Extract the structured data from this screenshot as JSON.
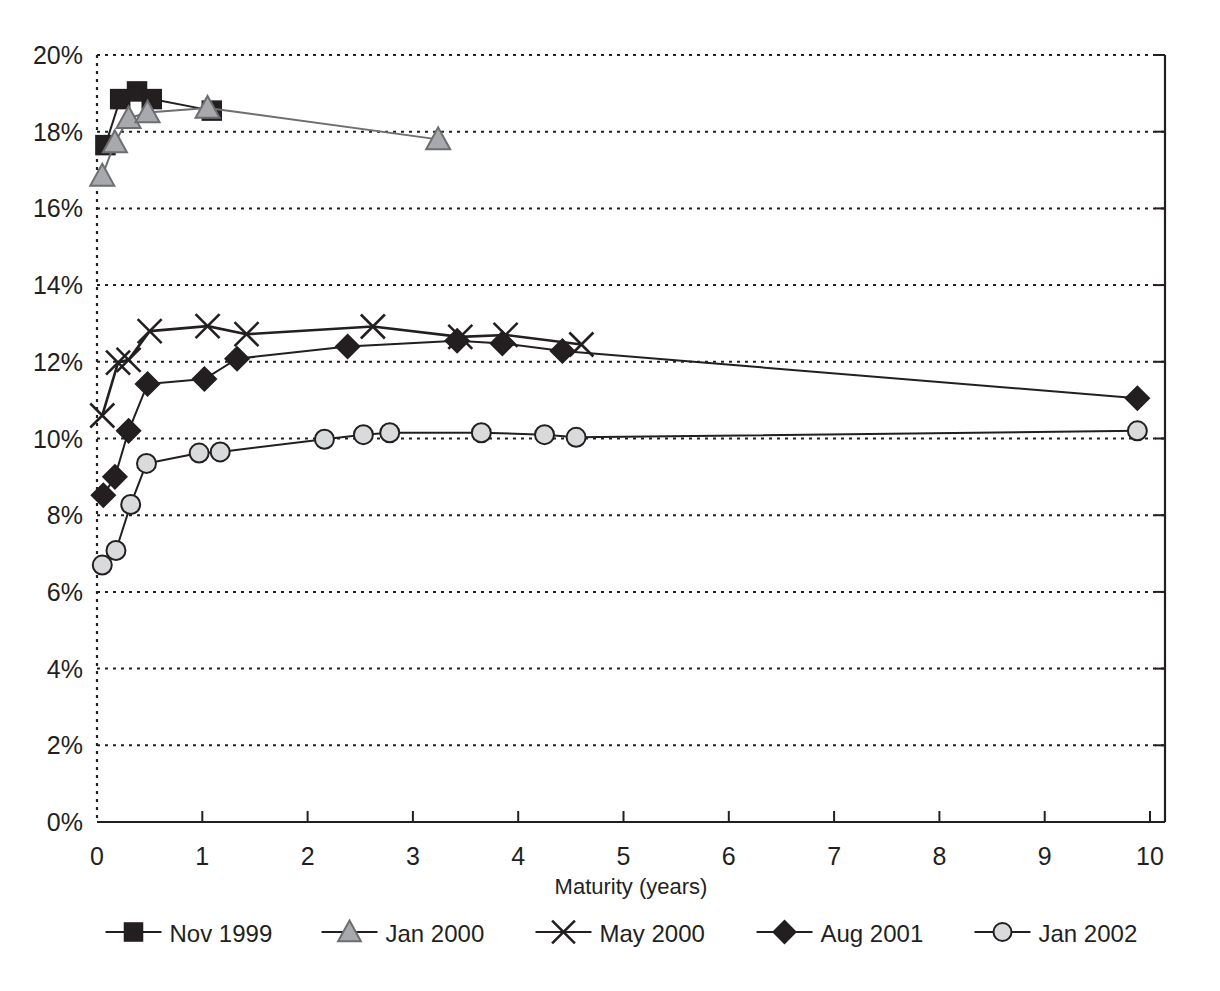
{
  "chart_data": {
    "type": "line",
    "title": "",
    "xlabel": "Maturity (years)",
    "ylabel": "",
    "xlim": [
      0,
      10
    ],
    "ylim": [
      0,
      20
    ],
    "grid": true,
    "grid_axis": "y",
    "legend_position": "bottom",
    "xticks": [
      "0",
      "1",
      "2",
      "3",
      "4",
      "5",
      "6",
      "7",
      "8",
      "9",
      "10"
    ],
    "yticks": [
      "0%",
      "2%",
      "4%",
      "6%",
      "8%",
      "10%",
      "12%",
      "14%",
      "16%",
      "18%",
      "20%"
    ],
    "y_unit": "percent",
    "series": [
      {
        "name": "Nov 1999",
        "marker": "filled-square",
        "color": "#231f20",
        "marker_fill": "#231f20",
        "points": [
          {
            "x": 0.08,
            "y": 17.65
          },
          {
            "x": 0.22,
            "y": 18.85
          },
          {
            "x": 0.38,
            "y": 19.05
          },
          {
            "x": 0.52,
            "y": 18.85
          },
          {
            "x": 1.09,
            "y": 18.55
          }
        ]
      },
      {
        "name": "Jan 2000",
        "marker": "filled-triangle",
        "color": "#6d6e71",
        "marker_fill": "#a7a9ac",
        "points": [
          {
            "x": 0.05,
            "y": 16.85
          },
          {
            "x": 0.17,
            "y": 17.72
          },
          {
            "x": 0.3,
            "y": 18.35
          },
          {
            "x": 0.48,
            "y": 18.5
          },
          {
            "x": 1.05,
            "y": 18.62
          },
          {
            "x": 3.24,
            "y": 17.8
          }
        ]
      },
      {
        "name": "May 2000",
        "marker": "cross-x",
        "color": "#231f20",
        "marker_fill": "none",
        "points": [
          {
            "x": 0.05,
            "y": 10.6
          },
          {
            "x": 0.2,
            "y": 11.98
          },
          {
            "x": 0.3,
            "y": 12.05
          },
          {
            "x": 0.5,
            "y": 12.8
          },
          {
            "x": 1.05,
            "y": 12.93
          },
          {
            "x": 1.42,
            "y": 12.72
          },
          {
            "x": 2.62,
            "y": 12.92
          },
          {
            "x": 3.45,
            "y": 12.65
          },
          {
            "x": 3.88,
            "y": 12.7
          },
          {
            "x": 4.6,
            "y": 12.45
          }
        ]
      },
      {
        "name": "Aug 2001",
        "marker": "filled-diamond",
        "color": "#231f20",
        "marker_fill": "#231f20",
        "points": [
          {
            "x": 0.06,
            "y": 8.52
          },
          {
            "x": 0.17,
            "y": 9.0
          },
          {
            "x": 0.3,
            "y": 10.2
          },
          {
            "x": 0.48,
            "y": 11.42
          },
          {
            "x": 1.02,
            "y": 11.55
          },
          {
            "x": 1.33,
            "y": 12.08
          },
          {
            "x": 2.38,
            "y": 12.4
          },
          {
            "x": 3.42,
            "y": 12.55
          },
          {
            "x": 3.85,
            "y": 12.48
          },
          {
            "x": 4.42,
            "y": 12.28
          },
          {
            "x": 9.88,
            "y": 11.05
          }
        ]
      },
      {
        "name": "Jan 2002",
        "marker": "circle",
        "color": "#231f20",
        "marker_fill": "#d9dadb",
        "points": [
          {
            "x": 0.05,
            "y": 6.7
          },
          {
            "x": 0.18,
            "y": 7.08
          },
          {
            "x": 0.32,
            "y": 8.28
          },
          {
            "x": 0.47,
            "y": 9.35
          },
          {
            "x": 0.97,
            "y": 9.62
          },
          {
            "x": 1.17,
            "y": 9.65
          },
          {
            "x": 2.16,
            "y": 9.98
          },
          {
            "x": 2.53,
            "y": 10.1
          },
          {
            "x": 2.78,
            "y": 10.15
          },
          {
            "x": 3.65,
            "y": 10.15
          },
          {
            "x": 4.25,
            "y": 10.1
          },
          {
            "x": 4.55,
            "y": 10.03
          },
          {
            "x": 9.88,
            "y": 10.2
          }
        ]
      }
    ],
    "legend": [
      {
        "label": "Nov 1999",
        "marker": "filled-square"
      },
      {
        "label": "Jan 2000",
        "marker": "filled-triangle"
      },
      {
        "label": "May 2000",
        "marker": "cross-x"
      },
      {
        "label": "Aug 2001",
        "marker": "filled-diamond"
      },
      {
        "label": "Jan 2002",
        "marker": "circle"
      }
    ]
  }
}
